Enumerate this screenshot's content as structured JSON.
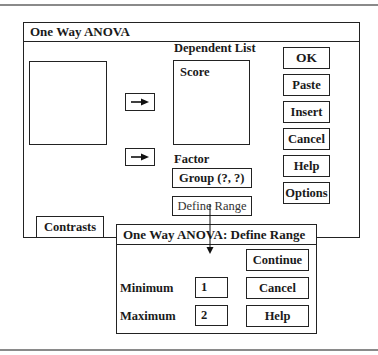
{
  "main_dialog": {
    "title": "One Way ANOVA",
    "dependent_list_label": "Dependent List",
    "dependent_list_items": [
      "Score"
    ],
    "factor_label": "Factor",
    "factor_value": "Group (?, ?)",
    "define_range_button": "Define Range",
    "contrasts_button": "Contrasts",
    "buttons": {
      "ok": "OK",
      "paste": "Paste",
      "insert": "Insert",
      "cancel": "Cancel",
      "help": "Help",
      "options": "Options"
    },
    "move_to_dependent_icon": "right-arrow-icon",
    "move_to_factor_icon": "right-arrow-icon"
  },
  "sub_dialog": {
    "title": "One Way ANOVA: Define Range",
    "minimum_label": "Minimum",
    "minimum_value": "1",
    "maximum_label": "Maximum",
    "maximum_value": "2",
    "buttons": {
      "continue": "Continue",
      "cancel": "Cancel",
      "help": "Help"
    }
  },
  "colors": {
    "border": "#222222",
    "rule": "#8a8a8a",
    "background": "#ffffff"
  }
}
